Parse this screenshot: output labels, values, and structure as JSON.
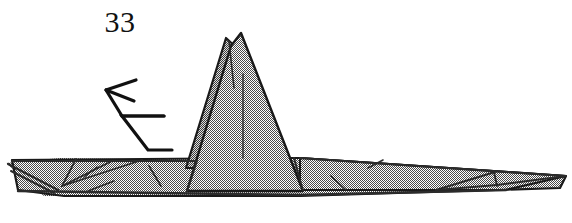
{
  "figure": {
    "kind": "origami-step-diagram",
    "step_number": "33",
    "caption": "",
    "canvas": {
      "width": 572,
      "height": 223
    },
    "colors": {
      "background": "#ffffff",
      "paper_fill": "#a8a8a8",
      "paper_fill_shadow": "#8f8f8f",
      "outline": "#1a1a1a",
      "crease_line": "#2b2b2b",
      "arrow": "#111111",
      "number_text": "#111111"
    },
    "shapes": [
      {
        "name": "left-wing-underlayer",
        "role": "paper-layer",
        "fill": "paper_fill_shadow",
        "points": "6,163 60,158 196,160 196,196 44,196"
      },
      {
        "name": "main-body-slab",
        "role": "paper-layer",
        "fill": "paper_fill",
        "points": "12,160 274,158 300,158 566,176 560,188 300,196 64,196 18,190"
      },
      {
        "name": "right-wing-panel",
        "role": "paper-layer",
        "fill": "paper_fill",
        "points": "300,158 566,176 505,190 300,190"
      },
      {
        "name": "central-peak-main",
        "role": "paper-layer",
        "fill": "paper_fill",
        "points": "241,34 302,190 186,190 226,42"
      },
      {
        "name": "central-peak-sliver",
        "role": "paper-layer",
        "fill": "paper_fill_shadow",
        "points": "226,38 236,46 196,166 186,166"
      }
    ],
    "creases": [
      {
        "name": "peak-center-crease",
        "d": "M 243,74 L 243,158"
      },
      {
        "name": "peak-left-inner-crease",
        "d": "M 228,40 L 232,86"
      },
      {
        "name": "peak-base-left-edge",
        "d": "M 196,160 L 186,190"
      },
      {
        "name": "peak-base-right-edge",
        "d": "M 294,158 L 302,190"
      },
      {
        "name": "left-wing-v-fold-upper",
        "d": "M 74,160 L 62,186"
      },
      {
        "name": "left-wing-v-fold-lower",
        "d": "M 62,186 L 110,162"
      },
      {
        "name": "left-wing-long-diagonal",
        "d": "M 62,186 L 140,160"
      },
      {
        "name": "left-wing-short-crease-a",
        "d": "M 82,178 L 96,168"
      },
      {
        "name": "left-wing-short-crease-b",
        "d": "M 88,192 L 112,182"
      },
      {
        "name": "left-wing-tip-fold-a",
        "d": "M 8,164 L 56,190"
      },
      {
        "name": "left-wing-tip-fold-b",
        "d": "M 10,170 L 52,192"
      },
      {
        "name": "mid-body-crease-left",
        "d": "M 148,166 L 160,186"
      },
      {
        "name": "mid-body-crease-right",
        "d": "M 156,162 L 166,160"
      },
      {
        "name": "right-body-crease-a",
        "d": "M 330,176 L 344,190"
      },
      {
        "name": "right-body-crease-b",
        "d": "M 368,168 L 382,160"
      },
      {
        "name": "right-tip-fold-upper",
        "d": "M 436,190 L 494,172"
      },
      {
        "name": "right-tip-fold-lower",
        "d": "M 436,190 L 496,184"
      },
      {
        "name": "right-tip-vertical",
        "d": "M 494,172 L 496,186"
      },
      {
        "name": "right-tip-long-edge",
        "d": "M 496,184 L 566,176"
      },
      {
        "name": "body-bottom-rim",
        "d": "M 18,190 L 300,194 L 505,190"
      },
      {
        "name": "body-top-rim-left",
        "d": "M 12,160 L 196,160"
      },
      {
        "name": "body-top-rim-right",
        "d": "M 300,158 L 566,176"
      }
    ],
    "arrow": {
      "name": "fold-direction-arrow",
      "description": "arrow pointing left indicating fold/rotate direction",
      "path": "M 172,150 L 148,150 L 122,116 L 164,116",
      "head_points": "106,90 134,80 132,90 134,100"
    }
  }
}
